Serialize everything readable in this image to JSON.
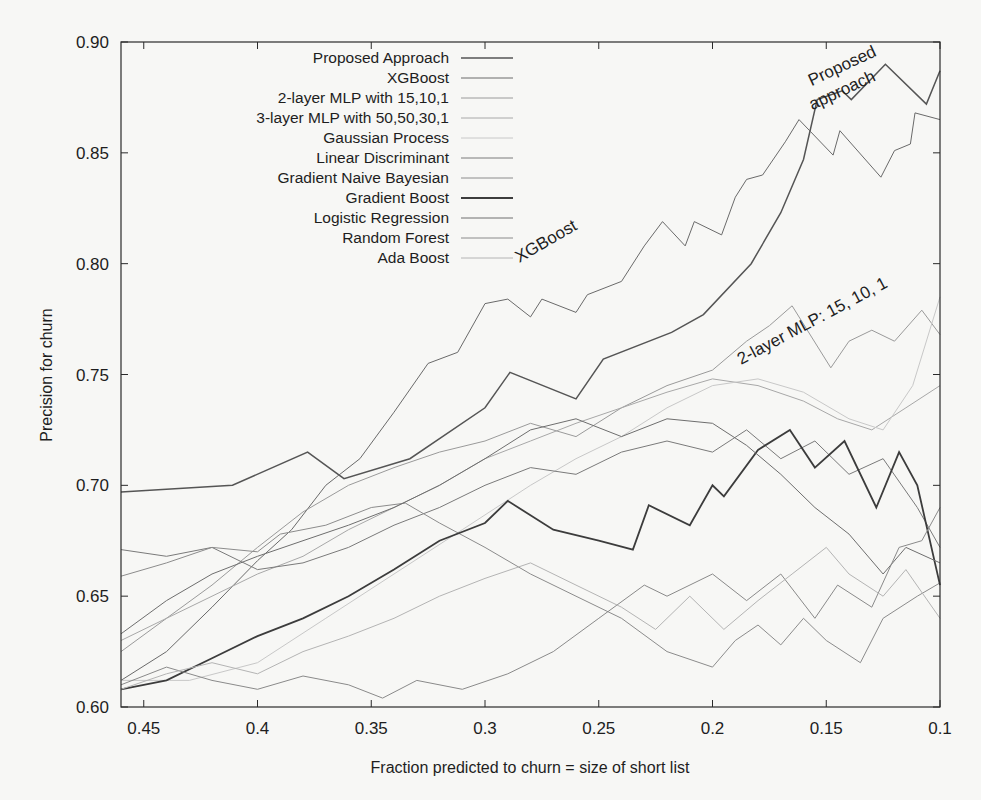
{
  "chart_data": {
    "type": "line",
    "title": "",
    "xlabel": "Fraction predicted to churn = size of short list",
    "ylabel": "Precision for churn",
    "xlim": [
      0.46,
      0.1
    ],
    "x_reversed": true,
    "ylim": [
      0.6,
      0.9
    ],
    "x_ticks": [
      0.45,
      0.4,
      0.35,
      0.3,
      0.25,
      0.2,
      0.15,
      0.1
    ],
    "x_tick_labels": [
      "0.45",
      "0.4",
      "0.35",
      "0.3",
      "0.25",
      "0.2",
      "0.15",
      "0.1"
    ],
    "y_ticks": [
      0.6,
      0.65,
      0.7,
      0.75,
      0.8,
      0.85,
      0.9
    ],
    "y_tick_labels": [
      "0.60",
      "0.65",
      "0.70",
      "0.75",
      "0.80",
      "0.85",
      "0.90"
    ],
    "grid": false,
    "legend_position": "upper-left-inside",
    "annotations": [
      {
        "text": "Proposed",
        "x": 0.142,
        "y": 0.887,
        "rotation": -25
      },
      {
        "text": "approach",
        "x": 0.142,
        "y": 0.876,
        "rotation": -25
      },
      {
        "text": "XGBoost",
        "x": 0.272,
        "y": 0.808,
        "rotation": -30
      },
      {
        "text": "2-layer MLP: 15, 10, 1",
        "x": 0.155,
        "y": 0.772,
        "rotation": -28
      }
    ],
    "series": [
      {
        "name": "Proposed Approach",
        "color": "#555555",
        "width": 1.5,
        "points": [
          [
            0.46,
            0.697
          ],
          [
            0.411,
            0.7
          ],
          [
            0.378,
            0.715
          ],
          [
            0.362,
            0.703
          ],
          [
            0.333,
            0.712
          ],
          [
            0.3,
            0.735
          ],
          [
            0.289,
            0.751
          ],
          [
            0.26,
            0.739
          ],
          [
            0.248,
            0.757
          ],
          [
            0.218,
            0.769
          ],
          [
            0.204,
            0.777
          ],
          [
            0.183,
            0.8
          ],
          [
            0.17,
            0.823
          ],
          [
            0.16,
            0.847
          ],
          [
            0.154,
            0.874
          ],
          [
            0.143,
            0.878
          ],
          [
            0.139,
            0.874
          ],
          [
            0.124,
            0.89
          ],
          [
            0.106,
            0.872
          ],
          [
            0.1,
            0.887
          ]
        ]
      },
      {
        "name": "XGBoost",
        "color": "#6a6a6a",
        "width": 1.0,
        "points": [
          [
            0.46,
            0.612
          ],
          [
            0.44,
            0.625
          ],
          [
            0.42,
            0.645
          ],
          [
            0.4,
            0.666
          ],
          [
            0.385,
            0.68
          ],
          [
            0.37,
            0.7
          ],
          [
            0.355,
            0.712
          ],
          [
            0.34,
            0.733
          ],
          [
            0.325,
            0.755
          ],
          [
            0.312,
            0.76
          ],
          [
            0.3,
            0.782
          ],
          [
            0.29,
            0.784
          ],
          [
            0.28,
            0.776
          ],
          [
            0.275,
            0.784
          ],
          [
            0.26,
            0.778
          ],
          [
            0.255,
            0.786
          ],
          [
            0.24,
            0.792
          ],
          [
            0.23,
            0.808
          ],
          [
            0.222,
            0.819
          ],
          [
            0.212,
            0.808
          ],
          [
            0.208,
            0.819
          ],
          [
            0.196,
            0.813
          ],
          [
            0.19,
            0.83
          ],
          [
            0.185,
            0.838
          ],
          [
            0.178,
            0.84
          ],
          [
            0.168,
            0.855
          ],
          [
            0.162,
            0.865
          ],
          [
            0.147,
            0.849
          ],
          [
            0.144,
            0.86
          ],
          [
            0.126,
            0.839
          ],
          [
            0.12,
            0.851
          ],
          [
            0.113,
            0.854
          ],
          [
            0.111,
            0.868
          ],
          [
            0.1,
            0.865
          ]
        ]
      },
      {
        "name": "2-layer MLP with 15,10,1",
        "color": "#9a9a9a",
        "width": 1.0,
        "points": [
          [
            0.46,
            0.625
          ],
          [
            0.44,
            0.64
          ],
          [
            0.42,
            0.655
          ],
          [
            0.4,
            0.672
          ],
          [
            0.38,
            0.688
          ],
          [
            0.36,
            0.7
          ],
          [
            0.34,
            0.708
          ],
          [
            0.32,
            0.715
          ],
          [
            0.3,
            0.72
          ],
          [
            0.28,
            0.728
          ],
          [
            0.26,
            0.722
          ],
          [
            0.24,
            0.735
          ],
          [
            0.22,
            0.745
          ],
          [
            0.2,
            0.752
          ],
          [
            0.185,
            0.765
          ],
          [
            0.175,
            0.772
          ],
          [
            0.165,
            0.781
          ],
          [
            0.148,
            0.753
          ],
          [
            0.14,
            0.765
          ],
          [
            0.13,
            0.77
          ],
          [
            0.12,
            0.765
          ],
          [
            0.108,
            0.779
          ],
          [
            0.1,
            0.768
          ]
        ]
      },
      {
        "name": "3-layer MLP with 50,50,30,1",
        "color": "#a8a8a8",
        "width": 1.0,
        "points": [
          [
            0.46,
            0.63
          ],
          [
            0.44,
            0.64
          ],
          [
            0.42,
            0.65
          ],
          [
            0.4,
            0.66
          ],
          [
            0.38,
            0.668
          ],
          [
            0.36,
            0.68
          ],
          [
            0.34,
            0.69
          ],
          [
            0.32,
            0.7
          ],
          [
            0.3,
            0.712
          ],
          [
            0.28,
            0.72
          ],
          [
            0.26,
            0.728
          ],
          [
            0.24,
            0.735
          ],
          [
            0.22,
            0.742
          ],
          [
            0.2,
            0.748
          ],
          [
            0.18,
            0.745
          ],
          [
            0.16,
            0.738
          ],
          [
            0.145,
            0.73
          ],
          [
            0.13,
            0.725
          ],
          [
            0.115,
            0.735
          ],
          [
            0.1,
            0.745
          ]
        ]
      },
      {
        "name": "Gaussian Process",
        "color": "#c8c8c8",
        "width": 1.0,
        "points": [
          [
            0.46,
            0.612
          ],
          [
            0.43,
            0.612
          ],
          [
            0.4,
            0.62
          ],
          [
            0.37,
            0.64
          ],
          [
            0.34,
            0.66
          ],
          [
            0.31,
            0.68
          ],
          [
            0.28,
            0.7
          ],
          [
            0.26,
            0.712
          ],
          [
            0.24,
            0.722
          ],
          [
            0.22,
            0.735
          ],
          [
            0.2,
            0.745
          ],
          [
            0.18,
            0.748
          ],
          [
            0.16,
            0.742
          ],
          [
            0.14,
            0.73
          ],
          [
            0.125,
            0.725
          ],
          [
            0.112,
            0.745
          ],
          [
            0.1,
            0.785
          ]
        ]
      },
      {
        "name": "Linear Discriminant",
        "color": "#7a7a7a",
        "width": 1.0,
        "points": [
          [
            0.46,
            0.671
          ],
          [
            0.44,
            0.668
          ],
          [
            0.42,
            0.672
          ],
          [
            0.4,
            0.662
          ],
          [
            0.38,
            0.665
          ],
          [
            0.36,
            0.672
          ],
          [
            0.34,
            0.682
          ],
          [
            0.32,
            0.69
          ],
          [
            0.3,
            0.7
          ],
          [
            0.28,
            0.708
          ],
          [
            0.26,
            0.705
          ],
          [
            0.24,
            0.715
          ],
          [
            0.22,
            0.72
          ],
          [
            0.2,
            0.715
          ],
          [
            0.185,
            0.725
          ],
          [
            0.17,
            0.712
          ],
          [
            0.155,
            0.72
          ],
          [
            0.14,
            0.705
          ],
          [
            0.125,
            0.712
          ],
          [
            0.11,
            0.69
          ],
          [
            0.1,
            0.672
          ]
        ]
      },
      {
        "name": "Gradient Naive Bayesian",
        "color": "#8c8c8c",
        "width": 1.0,
        "points": [
          [
            0.46,
            0.659
          ],
          [
            0.44,
            0.665
          ],
          [
            0.42,
            0.672
          ],
          [
            0.4,
            0.67
          ],
          [
            0.39,
            0.678
          ],
          [
            0.37,
            0.682
          ],
          [
            0.35,
            0.69
          ],
          [
            0.335,
            0.692
          ],
          [
            0.32,
            0.683
          ],
          [
            0.3,
            0.672
          ],
          [
            0.28,
            0.66
          ],
          [
            0.26,
            0.65
          ],
          [
            0.24,
            0.64
          ],
          [
            0.22,
            0.625
          ],
          [
            0.2,
            0.618
          ],
          [
            0.19,
            0.63
          ],
          [
            0.18,
            0.637
          ],
          [
            0.17,
            0.628
          ],
          [
            0.16,
            0.64
          ],
          [
            0.15,
            0.63
          ],
          [
            0.135,
            0.62
          ],
          [
            0.125,
            0.64
          ],
          [
            0.11,
            0.65
          ],
          [
            0.1,
            0.656
          ]
        ]
      },
      {
        "name": "Gradient Boost",
        "color": "#3c3c3c",
        "width": 1.8,
        "points": [
          [
            0.46,
            0.608
          ],
          [
            0.44,
            0.612
          ],
          [
            0.42,
            0.622
          ],
          [
            0.4,
            0.632
          ],
          [
            0.38,
            0.64
          ],
          [
            0.36,
            0.65
          ],
          [
            0.34,
            0.662
          ],
          [
            0.32,
            0.675
          ],
          [
            0.3,
            0.683
          ],
          [
            0.29,
            0.693
          ],
          [
            0.27,
            0.68
          ],
          [
            0.25,
            0.675
          ],
          [
            0.235,
            0.671
          ],
          [
            0.228,
            0.691
          ],
          [
            0.21,
            0.682
          ],
          [
            0.2,
            0.7
          ],
          [
            0.195,
            0.695
          ],
          [
            0.18,
            0.716
          ],
          [
            0.166,
            0.725
          ],
          [
            0.155,
            0.708
          ],
          [
            0.142,
            0.72
          ],
          [
            0.128,
            0.69
          ],
          [
            0.118,
            0.715
          ],
          [
            0.11,
            0.7
          ],
          [
            0.1,
            0.655
          ]
        ]
      },
      {
        "name": "Logistic Regression",
        "color": "#6e6e6e",
        "width": 1.0,
        "points": [
          [
            0.46,
            0.633
          ],
          [
            0.44,
            0.648
          ],
          [
            0.42,
            0.66
          ],
          [
            0.4,
            0.668
          ],
          [
            0.38,
            0.675
          ],
          [
            0.36,
            0.682
          ],
          [
            0.34,
            0.69
          ],
          [
            0.32,
            0.7
          ],
          [
            0.3,
            0.712
          ],
          [
            0.28,
            0.725
          ],
          [
            0.26,
            0.73
          ],
          [
            0.24,
            0.722
          ],
          [
            0.22,
            0.73
          ],
          [
            0.2,
            0.728
          ],
          [
            0.185,
            0.718
          ],
          [
            0.17,
            0.705
          ],
          [
            0.155,
            0.69
          ],
          [
            0.14,
            0.678
          ],
          [
            0.125,
            0.66
          ],
          [
            0.115,
            0.672
          ],
          [
            0.1,
            0.665
          ]
        ]
      },
      {
        "name": "Random Forest",
        "color": "#8a8a8a",
        "width": 1.0,
        "points": [
          [
            0.46,
            0.61
          ],
          [
            0.44,
            0.618
          ],
          [
            0.42,
            0.612
          ],
          [
            0.4,
            0.608
          ],
          [
            0.38,
            0.614
          ],
          [
            0.36,
            0.61
          ],
          [
            0.345,
            0.604
          ],
          [
            0.33,
            0.612
          ],
          [
            0.31,
            0.608
          ],
          [
            0.29,
            0.615
          ],
          [
            0.27,
            0.625
          ],
          [
            0.25,
            0.64
          ],
          [
            0.23,
            0.655
          ],
          [
            0.22,
            0.65
          ],
          [
            0.2,
            0.66
          ],
          [
            0.185,
            0.648
          ],
          [
            0.17,
            0.66
          ],
          [
            0.155,
            0.64
          ],
          [
            0.145,
            0.655
          ],
          [
            0.13,
            0.645
          ],
          [
            0.118,
            0.672
          ],
          [
            0.108,
            0.675
          ],
          [
            0.1,
            0.69
          ]
        ]
      },
      {
        "name": "Ada Boost",
        "color": "#b4b4b4",
        "width": 1.0,
        "points": [
          [
            0.46,
            0.608
          ],
          [
            0.44,
            0.615
          ],
          [
            0.42,
            0.62
          ],
          [
            0.4,
            0.615
          ],
          [
            0.38,
            0.625
          ],
          [
            0.36,
            0.632
          ],
          [
            0.34,
            0.64
          ],
          [
            0.32,
            0.65
          ],
          [
            0.3,
            0.658
          ],
          [
            0.28,
            0.665
          ],
          [
            0.26,
            0.655
          ],
          [
            0.24,
            0.645
          ],
          [
            0.225,
            0.635
          ],
          [
            0.21,
            0.65
          ],
          [
            0.195,
            0.635
          ],
          [
            0.18,
            0.648
          ],
          [
            0.165,
            0.66
          ],
          [
            0.15,
            0.672
          ],
          [
            0.14,
            0.66
          ],
          [
            0.125,
            0.65
          ],
          [
            0.115,
            0.662
          ],
          [
            0.1,
            0.64
          ]
        ]
      }
    ]
  }
}
